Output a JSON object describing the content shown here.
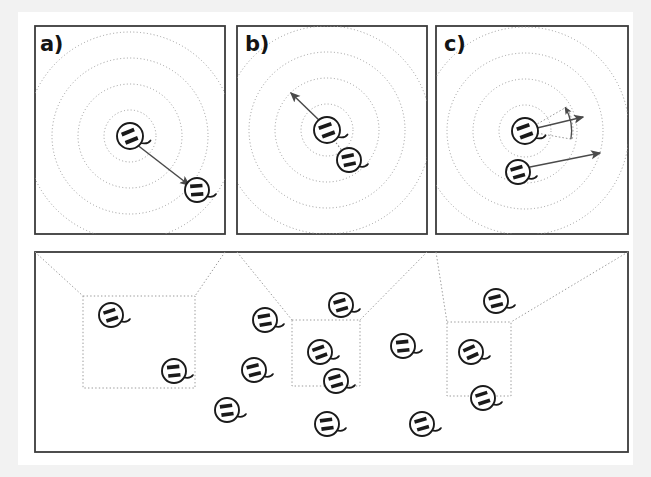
{
  "figure": {
    "kind": "scientific-figure-diagram",
    "background_color": "#f2f2f2",
    "page_color": "#ffffff",
    "ink_color": "#333333",
    "agent_color": "#1a1a1a",
    "dotted_color": "#9a9a9a",
    "arrow_color": "#4a4a4a"
  },
  "page": {
    "x": 18,
    "y": 12,
    "width": 615,
    "height": 453
  },
  "panels": [
    {
      "id": "panel-a",
      "label": "a)",
      "label_x": 40,
      "label_y": 34,
      "frame": {
        "x": 35,
        "y": 26,
        "width": 190,
        "height": 208
      },
      "rings": {
        "cx": 130,
        "cy": 136,
        "radii": [
          26,
          52,
          78,
          104
        ]
      },
      "agents": [
        {
          "id": "a-center",
          "cx": 130,
          "cy": 136,
          "r": 13,
          "rot": -22,
          "tail": 15
        },
        {
          "id": "a-target",
          "cx": 197,
          "cy": 190,
          "r": 12,
          "rot": -4,
          "tail": 10
        }
      ],
      "arrows": [
        {
          "id": "a-heading",
          "x1": 136,
          "y1": 144,
          "x2": 189,
          "y2": 185
        }
      ],
      "arcs": [],
      "links": []
    },
    {
      "id": "panel-b",
      "label": "b)",
      "label_x": 245,
      "label_y": 34,
      "frame": {
        "x": 237,
        "y": 26,
        "width": 190,
        "height": 208
      },
      "rings": {
        "cx": 327,
        "cy": 130,
        "radii": [
          26,
          52,
          78,
          104
        ]
      },
      "agents": [
        {
          "id": "b-center",
          "cx": 327,
          "cy": 130,
          "r": 13,
          "rot": -20,
          "tail": 15
        },
        {
          "id": "b-neighbor",
          "cx": 349,
          "cy": 160,
          "r": 12,
          "rot": -12,
          "tail": 11
        }
      ],
      "arrows": [
        {
          "id": "b-heading",
          "x1": 322,
          "y1": 123,
          "x2": 291,
          "y2": 93
        }
      ],
      "arcs": [],
      "links": [
        {
          "id": "b-link",
          "x1": 334,
          "y1": 140,
          "x2": 343,
          "y2": 152
        }
      ]
    },
    {
      "id": "panel-c",
      "label": "c)",
      "label_x": 444,
      "label_y": 34,
      "frame": {
        "x": 436,
        "y": 26,
        "width": 192,
        "height": 208
      },
      "rings": {
        "cx": 525,
        "cy": 131,
        "radii": [
          26,
          52,
          78,
          104
        ]
      },
      "agents": [
        {
          "id": "c-center",
          "cx": 525,
          "cy": 131,
          "r": 13,
          "rot": -20,
          "tail": 15
        },
        {
          "id": "c-neighbor",
          "cx": 518,
          "cy": 172,
          "r": 12,
          "rot": -16,
          "tail": 11
        }
      ],
      "arrows": [
        {
          "id": "c-heading-upper",
          "x1": 537,
          "y1": 128,
          "x2": 583,
          "y2": 117
        },
        {
          "id": "c-heading-lower",
          "x1": 530,
          "y1": 167,
          "x2": 600,
          "y2": 153
        }
      ],
      "arcs": [
        {
          "id": "c-rotation-arc",
          "cx": 525,
          "cy": 131,
          "r": 48,
          "a1": 30,
          "a2": -10
        }
      ],
      "wedge": {
        "cx": 525,
        "cy": 131,
        "r": 48,
        "a1": 30,
        "a2": -10
      },
      "links": []
    }
  ],
  "overview": {
    "id": "panel-overview",
    "frame": {
      "x": 35,
      "y": 252,
      "width": 593,
      "height": 200
    },
    "zoom_boxes": [
      {
        "id": "zoom-box-a",
        "x": 83,
        "y": 296,
        "width": 112,
        "height": 92,
        "source_panel": "panel-a"
      },
      {
        "id": "zoom-box-b",
        "x": 292,
        "y": 320,
        "width": 68,
        "height": 66,
        "source_panel": "panel-b"
      },
      {
        "id": "zoom-box-c",
        "x": 447,
        "y": 322,
        "width": 64,
        "height": 74,
        "source_panel": "panel-c"
      }
    ],
    "zoom_connectors": [
      {
        "id": "conn-a-left",
        "x1": 35,
        "y1": 252,
        "x2": 83,
        "y2": 296
      },
      {
        "id": "conn-a-right",
        "x1": 225,
        "y1": 252,
        "x2": 195,
        "y2": 296
      },
      {
        "id": "conn-b-left",
        "x1": 237,
        "y1": 252,
        "x2": 292,
        "y2": 320
      },
      {
        "id": "conn-b-right",
        "x1": 427,
        "y1": 252,
        "x2": 360,
        "y2": 320
      },
      {
        "id": "conn-c-left",
        "x1": 436,
        "y1": 252,
        "x2": 447,
        "y2": 322
      },
      {
        "id": "conn-c-right",
        "x1": 628,
        "y1": 252,
        "x2": 511,
        "y2": 322
      }
    ],
    "agents": [
      {
        "id": "ov-1",
        "cx": 111,
        "cy": 315,
        "r": 12,
        "rot": -18,
        "tail": 11
      },
      {
        "id": "ov-2",
        "cx": 174,
        "cy": 371,
        "r": 12,
        "rot": -6,
        "tail": 11
      },
      {
        "id": "ov-3",
        "cx": 265,
        "cy": 320,
        "r": 12,
        "rot": -10,
        "tail": 11
      },
      {
        "id": "ov-4",
        "cx": 227,
        "cy": 410,
        "r": 12,
        "rot": -8,
        "tail": 11
      },
      {
        "id": "ov-5",
        "cx": 254,
        "cy": 370,
        "r": 12,
        "rot": -14,
        "tail": 11
      },
      {
        "id": "ov-6",
        "cx": 341,
        "cy": 305,
        "r": 12,
        "rot": -16,
        "tail": 11
      },
      {
        "id": "ov-7",
        "cx": 320,
        "cy": 352,
        "r": 12,
        "rot": -20,
        "tail": 11
      },
      {
        "id": "ov-8",
        "cx": 336,
        "cy": 381,
        "r": 12,
        "rot": -16,
        "tail": 11
      },
      {
        "id": "ov-9",
        "cx": 327,
        "cy": 424,
        "r": 12,
        "rot": -8,
        "tail": 11
      },
      {
        "id": "ov-10",
        "cx": 403,
        "cy": 346,
        "r": 12,
        "rot": -6,
        "tail": 11
      },
      {
        "id": "ov-11",
        "cx": 422,
        "cy": 424,
        "r": 12,
        "rot": -16,
        "tail": 11
      },
      {
        "id": "ov-12",
        "cx": 496,
        "cy": 301,
        "r": 12,
        "rot": -14,
        "tail": 11
      },
      {
        "id": "ov-13",
        "cx": 471,
        "cy": 352,
        "r": 12,
        "rot": -24,
        "tail": 11
      },
      {
        "id": "ov-14",
        "cx": 483,
        "cy": 398,
        "r": 12,
        "rot": -18,
        "tail": 11
      }
    ]
  }
}
